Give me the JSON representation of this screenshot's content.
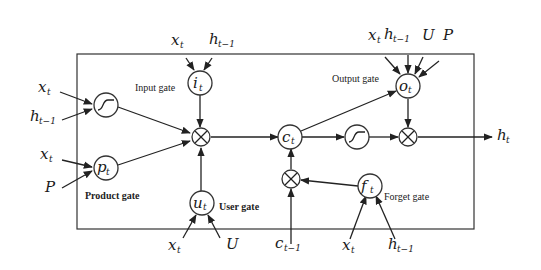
{
  "diagram": {
    "type": "gated recurrent cell",
    "gates": {
      "input": {
        "label": "Input gate",
        "symbol": "i",
        "sub": "t",
        "inputs": [
          {
            "v": "x",
            "s": "t"
          },
          {
            "v": "h",
            "s": "t−1"
          }
        ]
      },
      "product": {
        "label": "Product gate",
        "symbol": "p",
        "sub": "t",
        "inputs": [
          {
            "v": "x",
            "s": "t"
          },
          {
            "v": "P",
            "s": ""
          }
        ]
      },
      "user": {
        "label": "User gate",
        "symbol": "u",
        "sub": "t",
        "inputs": [
          {
            "v": "x",
            "s": "t"
          },
          {
            "v": "U",
            "s": ""
          }
        ]
      },
      "output": {
        "label": "Output gate",
        "symbol": "o",
        "sub": "t",
        "inputs": [
          {
            "v": "x",
            "s": "t"
          },
          {
            "v": "h",
            "s": "t−1"
          },
          {
            "v": "U",
            "s": ""
          },
          {
            "v": "P",
            "s": ""
          }
        ]
      },
      "forget": {
        "label": "Forget gate",
        "symbol": "f",
        "sub": "t",
        "inputs": [
          {
            "v": "x",
            "s": "t"
          },
          {
            "v": "h",
            "s": "t−1"
          }
        ]
      }
    },
    "tanh_input": {
      "inputs": [
        {
          "v": "x",
          "s": "t"
        },
        {
          "v": "h",
          "s": "t−1"
        }
      ]
    },
    "cell_state": {
      "symbol": "c",
      "sub": "t"
    },
    "prev_cell": {
      "symbol": "c",
      "sub": "t−1"
    },
    "output": {
      "symbol": "h",
      "sub": "t"
    },
    "operators": [
      "multiply",
      "multiply",
      "multiply",
      "tanh",
      "tanh"
    ]
  }
}
